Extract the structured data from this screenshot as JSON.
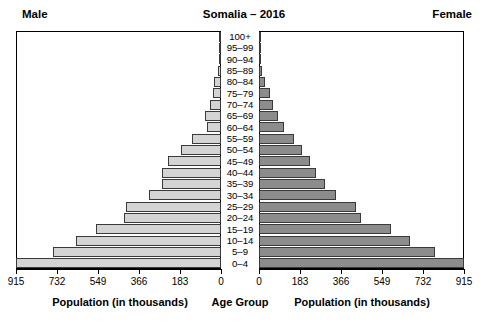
{
  "header": {
    "male_label": "Male",
    "female_label": "Female",
    "title": "Somalia – 2016"
  },
  "axis": {
    "male_title": "Population (in thousands)",
    "center_title": "Age Group",
    "female_title": "Population (in thousands)",
    "ticks": [
      "915",
      "732",
      "549",
      "366",
      "183",
      "0"
    ],
    "ticks_right": [
      "0",
      "183",
      "366",
      "549",
      "732",
      "915"
    ]
  },
  "colors": {
    "male_bar": "#d4d4d4",
    "female_bar": "#8c8c8c",
    "bar_border": "#3a3a3a",
    "frame": "#000000",
    "background": "#ffffff"
  },
  "chart_data": {
    "type": "bar",
    "subtype": "population-pyramid",
    "title": "Somalia – 2016",
    "xlabel": "Population (in thousands)",
    "ylabel": "Age Group",
    "xlim": [
      0,
      915
    ],
    "units": "thousands",
    "grid": false,
    "legend": [
      "Male",
      "Female"
    ],
    "legend_position": "top-corners",
    "categories": [
      "100+",
      "95–99",
      "90–94",
      "85–89",
      "80–84",
      "75–79",
      "70–74",
      "65–69",
      "60–64",
      "55–59",
      "50–54",
      "45–49",
      "40–44",
      "35–39",
      "30–34",
      "25–29",
      "20–24",
      "15–19",
      "10–14",
      "5–9",
      "0–4"
    ],
    "series": [
      {
        "name": "Male",
        "direction": "left",
        "values": [
          2,
          4,
          7,
          12,
          30,
          34,
          49,
          71,
          63,
          130,
          180,
          236,
          265,
          265,
          323,
          422,
          435,
          560,
          645,
          750,
          915
        ]
      },
      {
        "name": "Female",
        "direction": "right",
        "values": [
          2,
          4,
          7,
          12,
          28,
          49,
          63,
          86,
          112,
          156,
          190,
          226,
          256,
          295,
          342,
          433,
          455,
          587,
          675,
          785,
          915
        ]
      }
    ]
  }
}
